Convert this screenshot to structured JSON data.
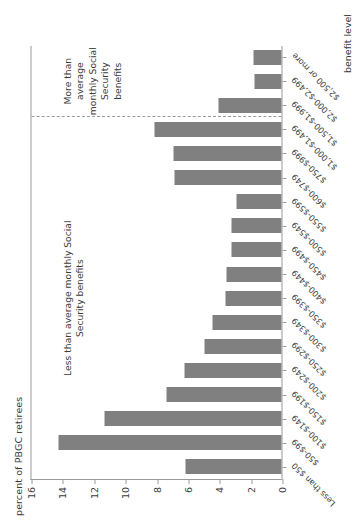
{
  "chart_data": {
    "type": "bar",
    "orientation": "vertical",
    "title": "",
    "xlabel": "benefit level",
    "ylabel": "percent of PBGC retirees",
    "ylim": [
      0,
      16
    ],
    "yticks": [
      0,
      2,
      4,
      6,
      8,
      10,
      12,
      14,
      16
    ],
    "grid": false,
    "legend": null,
    "bar_color": "#808080",
    "axis_color": "#9a9a9a",
    "categories": [
      "Less than $50",
      "$50-$99",
      "$100-$149",
      "$150-$199",
      "$200-$249",
      "$250-$299",
      "$300-$349",
      "$350-$399",
      "$400-$449",
      "$450-$499",
      "$500-$549",
      "$550-$599",
      "$600-$749",
      "$750-$999",
      "$1,000-$1,499",
      "$1,500-$1,999",
      "$2,000-$2,499",
      "$2,500 or more"
    ],
    "values": [
      6.1,
      14.2,
      11.3,
      7.3,
      6.2,
      4.9,
      4.4,
      3.6,
      3.5,
      3.2,
      3.2,
      2.9,
      6.8,
      6.9,
      8.1,
      4.0,
      1.7,
      1.8
    ],
    "annotations": [
      {
        "name": "less-than-average-annotation",
        "text": "Less than average monthly Social\nSecurity benefits",
        "region_categories": [
          "Less than $50",
          "$1,000-$1,499"
        ]
      },
      {
        "name": "more-than-average-annotation",
        "text": "More than average\nmonthly Social Security\nbenefits",
        "region_categories": [
          "$1,500-$1,999",
          "$2,500 or more"
        ]
      }
    ],
    "divider": {
      "name": "average-social-security-divider",
      "style": "dashed",
      "after_category": "$1,000-$1,499"
    }
  }
}
